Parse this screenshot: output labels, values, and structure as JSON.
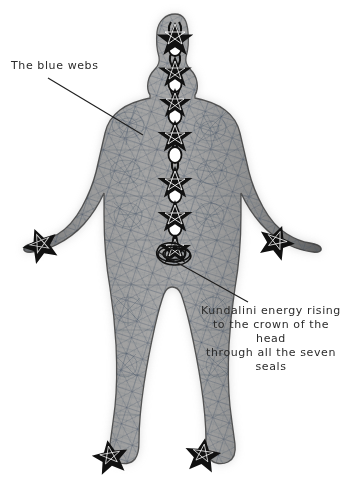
{
  "canvas": {
    "width": 351,
    "height": 493,
    "background_color": "#ffffff"
  },
  "illustration": {
    "name": "human-body-kundalini-diagram",
    "description": "Front-facing human figure with arms outstretched downward, covered in a fine blue web-like mesh texture, with a chain of seven seal symbols (stars and crescent/oval pairs) running up the central axis from the base of the spine to the crown of the head.",
    "body_fill_color": "#8d8d8d",
    "body_outline_color": "#3a3a3a",
    "web_color": "#4a5c70",
    "seal_color": "#151515",
    "glow_color": "#c9c9c9"
  },
  "annotations": [
    {
      "id": "blue-webs",
      "text": "The blue webs",
      "align": "left",
      "leader_from": [
        48,
        78
      ],
      "leader_to": [
        143,
        135
      ]
    },
    {
      "id": "kundalini",
      "text": "Kundalini energy rising\nto the crown of the head\nthrough all the seven\nseals",
      "align": "center",
      "leader_from": [
        158,
        252
      ],
      "leader_to": [
        248,
        302
      ]
    }
  ],
  "seals": {
    "count": 7,
    "label": "seven seals",
    "positions_y": [
      32,
      68,
      100,
      132,
      178,
      212,
      245
    ],
    "coil_y": 252
  },
  "marks": {
    "palm_stars": [
      [
        40,
        240
      ],
      [
        277,
        237
      ]
    ],
    "foot_stars": [
      [
        110,
        452
      ],
      [
        203,
        450
      ]
    ]
  },
  "text_color": "#2b2b2b",
  "leader_line_color": "#1d1d1d"
}
